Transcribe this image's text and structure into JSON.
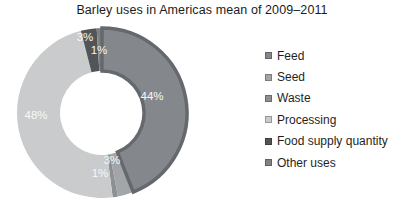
{
  "title": "Barley uses in Americas mean of 2009–2011",
  "chart_data": {
    "type": "pie",
    "subtype": "donut",
    "title": "Barley uses in Americas mean of 2009–2011",
    "categories": [
      "Feed",
      "Seed",
      "Waste",
      "Processing",
      "Food supply quantity",
      "Other uses"
    ],
    "values": [
      44,
      3,
      1,
      48,
      3,
      1
    ],
    "unit": "%",
    "slice_labels": [
      "44%",
      "3%",
      "1%",
      "48%",
      "3%",
      "1%"
    ],
    "slice_colors": [
      "#84888c",
      "#a3a6a8",
      "#8d9092",
      "#c9cbcc",
      "#515558",
      "#7e8285"
    ],
    "feed_edge_color": "#65696d",
    "label_color": "#f7f7f7",
    "legend_position": "right",
    "start_angle_deg": 0,
    "direction": "clockwise",
    "hole_color": "#ffffff",
    "background_color": "#ffffff"
  }
}
